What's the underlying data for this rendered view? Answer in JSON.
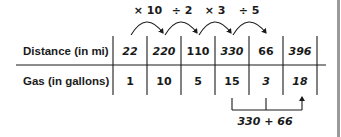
{
  "table": {
    "row_headers": [
      "Distance (in mi)",
      "Gas (in gallons)"
    ],
    "distance": [
      "22",
      "220",
      "110",
      "330",
      "66",
      "396"
    ],
    "gas": [
      "1",
      "10",
      "5",
      "15",
      "3",
      "18"
    ]
  },
  "operations": [
    "× 10",
    "÷ 2",
    "× 3",
    "÷ 5"
  ],
  "sum_annotation": "330 + 66",
  "colors": {
    "ink": "#1a1a1a",
    "border_bar": "#9a9a9a",
    "background": "#ffffff"
  }
}
